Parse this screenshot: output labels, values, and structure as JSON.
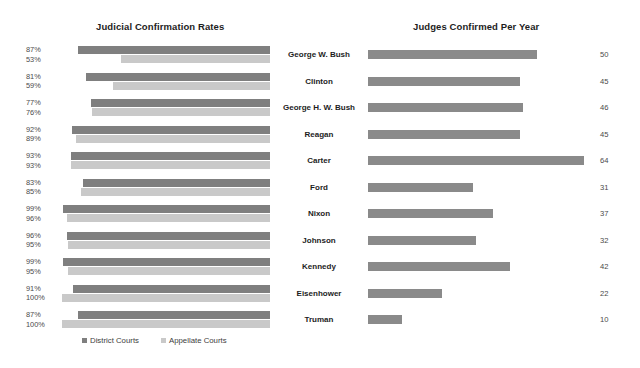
{
  "left_panel": {
    "title": "Judicial Confirmation Rates"
  },
  "right_panel": {
    "title": "Judges Confirmed Per Year"
  },
  "legend": {
    "items": [
      {
        "label": "District Courts",
        "color": "#7f7f7f"
      },
      {
        "label": "Appellate Courts",
        "color": "#c9c9c9"
      }
    ]
  },
  "chart_data": {
    "type": "bar",
    "orientation": "horizontal",
    "categories": [
      "George W. Bush",
      "Clinton",
      "George H. W. Bush",
      "Reagan",
      "Carter",
      "Ford",
      "Nixon",
      "Johnson",
      "Kennedy",
      "Eisenhower",
      "Truman"
    ],
    "panels": [
      {
        "name": "Judicial Confirmation Rates",
        "xlabel": "",
        "ylabel": "",
        "unit": "%",
        "xlim": [
          0,
          100
        ],
        "grid": false,
        "direction": "right-to-left",
        "series": [
          {
            "name": "District Courts",
            "color": "#7f7f7f",
            "values": [
              87,
              81,
              77,
              92,
              93,
              83,
              99,
              96,
              99,
              91,
              87
            ],
            "labels": [
              "87%",
              "81%",
              "77%",
              "92%",
              "93%",
              "83%",
              "99%",
              "96%",
              "99%",
              "91%",
              "87%"
            ]
          },
          {
            "name": "Appellate Courts",
            "color": "#c9c9c9",
            "values": [
              53,
              59,
              76,
              89,
              93,
              85,
              96,
              95,
              95,
              100,
              100
            ],
            "labels": [
              "53%",
              "59%",
              "76%",
              "89%",
              "93%",
              "85%",
              "96%",
              "95%",
              "95%",
              "100%",
              "100%"
            ]
          }
        ]
      },
      {
        "name": "Judges Confirmed Per Year",
        "xlabel": "",
        "ylabel": "",
        "unit": "judges/year",
        "xlim": [
          0,
          64
        ],
        "grid": false,
        "direction": "left-to-right",
        "series": [
          {
            "name": "Judges Confirmed Per Year",
            "color": "#8a8a8a",
            "values": [
              50,
              45,
              46,
              45,
              64,
              31,
              37,
              32,
              42,
              22,
              10
            ],
            "labels": [
              "50",
              "45",
              "46",
              "45",
              "64",
              "31",
              "37",
              "32",
              "42",
              "22",
              "10"
            ]
          }
        ]
      }
    ]
  }
}
